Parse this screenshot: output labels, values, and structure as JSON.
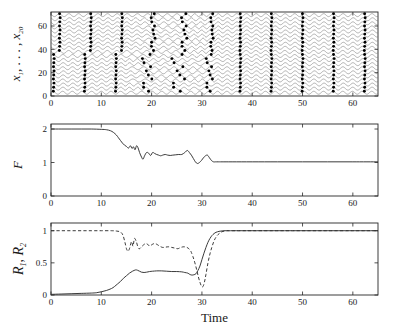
{
  "figure": {
    "title": "",
    "xlabel": "Time",
    "panels": [
      "oscillator-raster",
      "order-parameter-F",
      "sync-indices-R"
    ]
  },
  "chart_data": [
    {
      "type": "line",
      "panel": "top",
      "title": "",
      "xlabel": "",
      "ylabel": "x_1, . . . , x_20",
      "ylabel_base": "x",
      "ylabel_sub1": "1",
      "ylabel_mid": ", . . . ,",
      "ylabel_base2": "x",
      "ylabel_sub2": "20",
      "xlim": [
        0,
        65
      ],
      "ylim": [
        0,
        72
      ],
      "xticks": [
        0,
        10,
        20,
        30,
        40,
        50,
        60
      ],
      "yticks": [
        0,
        20,
        40,
        60
      ],
      "n_traces": 20,
      "trace_spacing": 3.5,
      "trace_amplitude": 1.25,
      "description": "20 stacked oscillator time series with peak markers (dots). Group A (traces 1-10, lower) and Group B (traces 11-20, upper) are initially phase-locked within group but mutually desynchronized; between t=15 and t=33 the markers scatter, after t=35 all 20 markers align in vertical columns indicating global synchrony.",
      "marker": "filled-circle",
      "peak_columns_synced_early": [
        0.6,
        2.4,
        4.3,
        5.6,
        7.4,
        9.3,
        10.4,
        12.3,
        13.4
      ],
      "peak_columns_synced_late": [
        38.6,
        44.8,
        51.0,
        57.2,
        63.4
      ],
      "grid": false
    },
    {
      "type": "line",
      "panel": "middle",
      "title": "",
      "xlabel": "",
      "ylabel": "F",
      "xlim": [
        0,
        65
      ],
      "ylim": [
        0,
        2.15
      ],
      "xticks": [
        0,
        10,
        20,
        30,
        40,
        50,
        60
      ],
      "yticks": [
        0,
        1,
        2
      ],
      "series": [
        {
          "name": "F",
          "style": "solid",
          "x": [
            0,
            2,
            4,
            6,
            8,
            10,
            11,
            11.8,
            12.4,
            13,
            13.4,
            13.8,
            14.2,
            14.6,
            15,
            15.4,
            15.8,
            16.1,
            16.4,
            16.7,
            17,
            17.3,
            17.6,
            18,
            18.3,
            18.6,
            19,
            19.4,
            19.8,
            20.2,
            20.6,
            21,
            21.4,
            21.8,
            22.2,
            22.7,
            23.2,
            23.7,
            24.2,
            24.8,
            25.4,
            26,
            26.6,
            27.1,
            27.5,
            27.9,
            28.3,
            28.7,
            29.1,
            29.5,
            29.9,
            30.3,
            30.7,
            31.1,
            31.5,
            31.9,
            32.3,
            32.7,
            33.2,
            34,
            36,
            40,
            45,
            50,
            55,
            60,
            65
          ],
          "y": [
            2.0,
            2.0,
            2.0,
            2.0,
            2.0,
            1.99,
            1.98,
            1.95,
            1.9,
            1.82,
            1.74,
            1.66,
            1.58,
            1.52,
            1.48,
            1.43,
            1.5,
            1.42,
            1.47,
            1.38,
            1.5,
            1.44,
            1.3,
            1.16,
            1.1,
            1.2,
            1.3,
            1.28,
            1.21,
            1.3,
            1.27,
            1.24,
            1.22,
            1.2,
            1.22,
            1.24,
            1.22,
            1.21,
            1.22,
            1.23,
            1.24,
            1.24,
            1.3,
            1.36,
            1.3,
            1.22,
            1.12,
            1.02,
            0.97,
            1.0,
            1.06,
            1.14,
            1.2,
            1.22,
            1.14,
            1.06,
            1.02,
            1.02,
            1.02,
            1.02,
            1.02,
            1.02,
            1.02,
            1.02,
            1.02,
            1.02,
            1.02
          ]
        }
      ],
      "grid": false
    },
    {
      "type": "line",
      "panel": "bottom",
      "title": "",
      "xlabel": "Time",
      "ylabel": "R_1, R_2",
      "ylabel_base1": "R",
      "ylabel_sub1": "1",
      "ylabel_base2": "R",
      "ylabel_sub2": "2",
      "xlim": [
        0,
        65
      ],
      "ylim": [
        0,
        1.12
      ],
      "xticks": [
        0,
        10,
        20,
        30,
        40,
        50,
        60
      ],
      "yticks": [
        0,
        0.5,
        1
      ],
      "series": [
        {
          "name": "R1",
          "style": "solid",
          "x": [
            0,
            2,
            4,
            6,
            8,
            9,
            10,
            11,
            12,
            12.6,
            13.2,
            13.8,
            14.4,
            15,
            15.6,
            16.2,
            16.8,
            17.2,
            17.6,
            18,
            18.5,
            19,
            19.6,
            20.2,
            21,
            22,
            23,
            24,
            25,
            26,
            26.6,
            27.2,
            27.6,
            28,
            28.4,
            28.8,
            29.2,
            29.6,
            30,
            30.4,
            30.8,
            31.2,
            31.6,
            32,
            32.4,
            32.8,
            33.4,
            34,
            34.6,
            35.2,
            36,
            38,
            42,
            48,
            54,
            60,
            65
          ],
          "y": [
            0.01,
            0.015,
            0.02,
            0.025,
            0.03,
            0.035,
            0.05,
            0.07,
            0.1,
            0.13,
            0.17,
            0.21,
            0.26,
            0.3,
            0.34,
            0.37,
            0.39,
            0.385,
            0.37,
            0.355,
            0.35,
            0.355,
            0.365,
            0.37,
            0.375,
            0.375,
            0.37,
            0.365,
            0.365,
            0.36,
            0.35,
            0.34,
            0.32,
            0.31,
            0.315,
            0.33,
            0.38,
            0.45,
            0.55,
            0.65,
            0.74,
            0.82,
            0.88,
            0.925,
            0.955,
            0.975,
            0.99,
            0.997,
            1.0,
            1.0,
            1.0,
            1.0,
            1.0,
            1.0,
            1.0,
            1.0,
            1.0
          ]
        },
        {
          "name": "R2",
          "style": "dashed",
          "x": [
            0,
            2,
            4,
            6,
            8,
            10,
            12,
            13,
            13.8,
            14.3,
            14.7,
            15,
            15.3,
            15.6,
            16,
            16.3,
            16.6,
            17,
            17.3,
            17.6,
            18,
            18.4,
            18.8,
            19.2,
            19.6,
            20,
            20.5,
            21,
            21.6,
            22.2,
            22.8,
            23.4,
            24,
            24.6,
            25.2,
            25.8,
            26.4,
            27,
            27.4,
            27.8,
            28.2,
            28.6,
            29,
            29.3,
            29.6,
            29.9,
            30.2,
            30.5,
            30.8,
            31.2,
            31.6,
            32,
            32.4,
            32.8,
            33.2,
            33.6,
            34,
            34.5,
            35,
            35.6,
            36.4,
            38,
            42,
            48,
            54,
            60,
            65
          ],
          "y": [
            1.0,
            1.0,
            1.0,
            1.0,
            1.0,
            1.0,
            1.0,
            0.995,
            0.98,
            0.93,
            0.82,
            0.72,
            0.68,
            0.72,
            0.83,
            0.76,
            0.88,
            0.82,
            0.74,
            0.72,
            0.75,
            0.78,
            0.8,
            0.79,
            0.76,
            0.78,
            0.8,
            0.79,
            0.76,
            0.74,
            0.745,
            0.75,
            0.74,
            0.73,
            0.72,
            0.74,
            0.75,
            0.74,
            0.72,
            0.68,
            0.6,
            0.5,
            0.38,
            0.28,
            0.2,
            0.14,
            0.13,
            0.2,
            0.32,
            0.5,
            0.64,
            0.75,
            0.84,
            0.9,
            0.94,
            0.965,
            0.985,
            0.995,
            1.0,
            1.0,
            1.0,
            1.0,
            1.0,
            1.0,
            1.0,
            1.0,
            1.0
          ]
        }
      ],
      "grid": false
    }
  ],
  "ticklabels": {
    "x": [
      "0",
      "10",
      "20",
      "30",
      "40",
      "50",
      "60"
    ],
    "y_top": [
      "0",
      "20",
      "40",
      "60"
    ],
    "y_mid": [
      "0",
      "1",
      "2"
    ],
    "y_bot": [
      "0",
      "0.5",
      "1"
    ]
  },
  "colors": {
    "axis": "#262626",
    "curve": "#303030",
    "marker": "#000000",
    "background": "#ffffff"
  }
}
